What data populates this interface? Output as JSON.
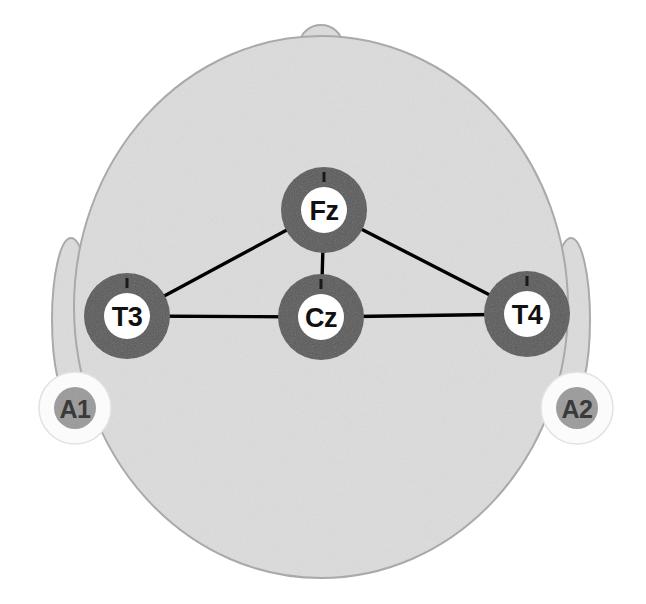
{
  "diagram": {
    "view": "top-down head schematic",
    "colors": {
      "background": "#ffffff",
      "scalp_fill": "#dcdcdc",
      "scalp_outline": "#a8a8a8",
      "ear_fill": "#dcdcdc",
      "ear_outline": "#a8a8a8",
      "electrode_ring": "#595959",
      "electrode_inner": "#ffffff",
      "electrode_label": "#111111",
      "reference_outer": "#fbfbfb",
      "reference_inner": "#9a9a9a",
      "reference_label": "#3a3a3a",
      "connection_line": "#000000",
      "tick_mark": "#1a1a1a"
    },
    "head": {
      "cx": 321,
      "cy": 307,
      "rx": 247,
      "ry": 271
    },
    "nose": {
      "cx": 321,
      "cy": 44,
      "rx": 21,
      "ry": 17
    },
    "ears": [
      {
        "name": "left-ear",
        "cx": 71,
        "cy": 320,
        "rx": 19,
        "ry": 82
      },
      {
        "name": "right-ear",
        "cx": 571,
        "cy": 320,
        "rx": 19,
        "ry": 82
      }
    ],
    "scalp_electrodes": [
      {
        "id": "Fz",
        "label": "Fz",
        "cx": 324,
        "cy": 210,
        "ring_r": 43,
        "inner_r": 23,
        "tick": true
      },
      {
        "id": "Cz",
        "label": "Cz",
        "cx": 321,
        "cy": 317,
        "ring_r": 43,
        "inner_r": 23,
        "tick": true
      },
      {
        "id": "T3",
        "label": "T3",
        "cx": 127,
        "cy": 316,
        "ring_r": 43,
        "inner_r": 23,
        "tick": true
      },
      {
        "id": "T4",
        "label": "T4",
        "cx": 527,
        "cy": 314,
        "ring_r": 43,
        "inner_r": 23,
        "tick": true
      }
    ],
    "reference_electrodes": [
      {
        "id": "A1",
        "label": "A1",
        "cx": 75,
        "cy": 408,
        "outer_r": 36,
        "inner_r": 21
      },
      {
        "id": "A2",
        "label": "A2",
        "cx": 577,
        "cy": 408,
        "outer_r": 36,
        "inner_r": 21
      }
    ],
    "connections": [
      {
        "from": "Fz",
        "to": "Cz",
        "x1": 324,
        "y1": 210,
        "x2": 321,
        "y2": 317
      },
      {
        "from": "Fz",
        "to": "T3",
        "x1": 324,
        "y1": 210,
        "x2": 127,
        "y2": 316
      },
      {
        "from": "Fz",
        "to": "T4",
        "x1": 324,
        "y1": 210,
        "x2": 527,
        "y2": 314
      },
      {
        "from": "T3",
        "to": "Cz",
        "x1": 127,
        "y1": 316,
        "x2": 321,
        "y2": 317
      },
      {
        "from": "Cz",
        "to": "T4",
        "x1": 321,
        "y1": 317,
        "x2": 527,
        "y2": 314
      }
    ]
  }
}
